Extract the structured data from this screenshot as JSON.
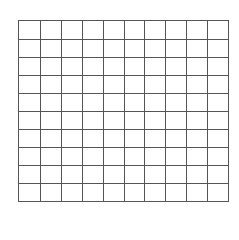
{
  "grid": {
    "rows": 10,
    "columns": 10,
    "line_color": "#555555",
    "background": "#ffffff"
  }
}
